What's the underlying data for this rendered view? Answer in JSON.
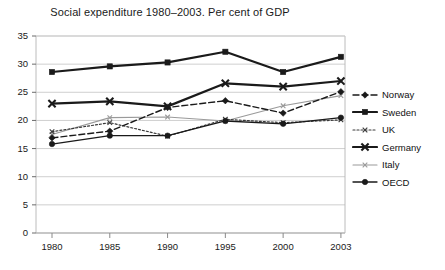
{
  "chart_data": {
    "type": "line",
    "title": "Social expenditure 1980–2003. Per cent of GDP",
    "xlabel": "",
    "ylabel": "",
    "categories": [
      "1980",
      "1985",
      "1990",
      "1995",
      "2000",
      "2003"
    ],
    "x": [
      1980,
      1985,
      1990,
      1995,
      2000,
      2003
    ],
    "ylim": [
      0,
      35
    ],
    "ytick_labels": [
      "0",
      "5",
      "10",
      "15",
      "20",
      "25",
      "30",
      "35"
    ],
    "yticks": [
      0,
      5,
      10,
      15,
      20,
      25,
      30,
      35
    ],
    "grid": "horizontal",
    "legend_position": "right",
    "series": [
      {
        "name": "Norway",
        "values": [
          16.9,
          18.1,
          22.3,
          23.5,
          21.3,
          25.1
        ],
        "color": "#1a1a1a",
        "dash": "6,3",
        "width": 1.4,
        "marker": "diamond"
      },
      {
        "name": "Sweden",
        "values": [
          28.6,
          29.6,
          30.3,
          32.2,
          28.6,
          31.3
        ],
        "color": "#1a1a1a",
        "dash": "none",
        "width": 2.2,
        "marker": "square"
      },
      {
        "name": "UK",
        "values": [
          18.0,
          19.6,
          17.2,
          20.2,
          19.6,
          20.1
        ],
        "color": "#3a3a3a",
        "dash": "2,2",
        "width": 1.2,
        "marker": "x-small"
      },
      {
        "name": "Germany",
        "values": [
          23.0,
          23.4,
          22.5,
          26.6,
          26.0,
          27.0
        ],
        "color": "#1a1a1a",
        "dash": "none",
        "width": 2.2,
        "marker": "x-bold"
      },
      {
        "name": "Italy",
        "values": [
          17.5,
          20.5,
          20.6,
          19.9,
          22.6,
          24.4
        ],
        "color": "#9a9a9a",
        "dash": "none",
        "width": 1.1,
        "marker": "x-small"
      },
      {
        "name": "OECD",
        "values": [
          15.8,
          17.3,
          17.3,
          19.9,
          19.4,
          20.5
        ],
        "color": "#1a1a1a",
        "dash": "none",
        "width": 1.3,
        "marker": "circle"
      }
    ]
  },
  "legend": {
    "items": [
      {
        "label": "Norway"
      },
      {
        "label": "Sweden"
      },
      {
        "label": "UK"
      },
      {
        "label": "Germany"
      },
      {
        "label": "Italy"
      },
      {
        "label": "OECD"
      }
    ]
  }
}
